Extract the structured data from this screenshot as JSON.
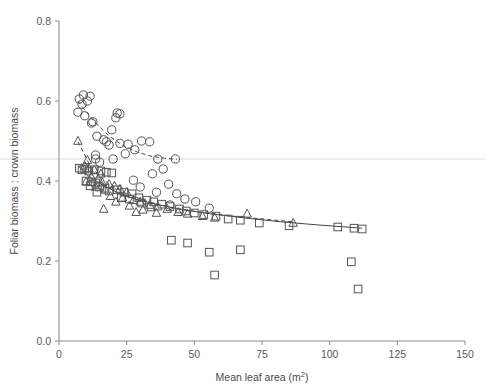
{
  "chart_data": {
    "type": "scatter",
    "title": "",
    "xlabel": "Mean leaf area (m²)",
    "ylabel": "Foliar biomass : crown biomass",
    "xlim": [
      0,
      150
    ],
    "ylim": [
      0.0,
      0.8
    ],
    "xticks": [
      0,
      25,
      50,
      75,
      100,
      125,
      150
    ],
    "xtick_labels": [
      "0",
      "25",
      "50",
      "75",
      "100",
      "125",
      "150"
    ],
    "yticks": [
      0.0,
      0.2,
      0.4,
      0.6,
      0.8
    ],
    "ytick_labels": [
      "0.0",
      "0.2",
      "0.4",
      "0.6",
      "0.8"
    ],
    "grid": false,
    "legend": "none",
    "marker_color": "#555555",
    "line_color": "#444444",
    "artifact_line_color": "#ededed",
    "artifact_line_y": 0.455,
    "series": [
      {
        "name": "circles",
        "marker": "circle",
        "points": [
          [
            7.5,
            0.605
          ],
          [
            8.5,
            0.592
          ],
          [
            9.0,
            0.615
          ],
          [
            10.5,
            0.6
          ],
          [
            11.5,
            0.612
          ],
          [
            7.0,
            0.572
          ],
          [
            9.5,
            0.563
          ],
          [
            12.0,
            0.545
          ],
          [
            12.5,
            0.548
          ],
          [
            21.5,
            0.57
          ],
          [
            22.5,
            0.568
          ],
          [
            21.0,
            0.558
          ],
          [
            19.5,
            0.528
          ],
          [
            14.0,
            0.512
          ],
          [
            16.5,
            0.503
          ],
          [
            17.5,
            0.498
          ],
          [
            18.5,
            0.49
          ],
          [
            22.5,
            0.494
          ],
          [
            25.5,
            0.492
          ],
          [
            30.5,
            0.5
          ],
          [
            33.5,
            0.498
          ],
          [
            28.0,
            0.478
          ],
          [
            24.5,
            0.468
          ],
          [
            13.5,
            0.465
          ],
          [
            13.5,
            0.455
          ],
          [
            15.0,
            0.447
          ],
          [
            20.0,
            0.455
          ],
          [
            36.5,
            0.455
          ],
          [
            43.0,
            0.455
          ],
          [
            38.5,
            0.43
          ],
          [
            34.5,
            0.418
          ],
          [
            27.5,
            0.402
          ],
          [
            40.5,
            0.392
          ],
          [
            30.0,
            0.385
          ],
          [
            36.0,
            0.372
          ],
          [
            43.5,
            0.368
          ],
          [
            46.5,
            0.355
          ],
          [
            50.5,
            0.348
          ],
          [
            41.0,
            0.34
          ],
          [
            55.5,
            0.332
          ]
        ]
      },
      {
        "name": "triangles",
        "marker": "triangle",
        "points": [
          [
            7.0,
            0.5
          ],
          [
            10.5,
            0.452
          ],
          [
            9.5,
            0.438
          ],
          [
            11.0,
            0.432
          ],
          [
            13.0,
            0.428
          ],
          [
            15.5,
            0.418
          ],
          [
            12.0,
            0.41
          ],
          [
            14.5,
            0.405
          ],
          [
            10.0,
            0.398
          ],
          [
            16.0,
            0.396
          ],
          [
            13.5,
            0.385
          ],
          [
            18.5,
            0.392
          ],
          [
            20.5,
            0.388
          ],
          [
            17.0,
            0.378
          ],
          [
            22.5,
            0.38
          ],
          [
            25.0,
            0.372
          ],
          [
            19.0,
            0.362
          ],
          [
            23.5,
            0.358
          ],
          [
            21.0,
            0.348
          ],
          [
            27.5,
            0.352
          ],
          [
            30.0,
            0.348
          ],
          [
            26.0,
            0.338
          ],
          [
            16.5,
            0.33
          ],
          [
            33.5,
            0.34
          ],
          [
            36.5,
            0.336
          ],
          [
            31.0,
            0.328
          ],
          [
            40.0,
            0.33
          ],
          [
            44.0,
            0.322
          ],
          [
            47.5,
            0.318
          ],
          [
            53.0,
            0.312
          ],
          [
            57.5,
            0.308
          ],
          [
            69.5,
            0.318
          ],
          [
            86.5,
            0.295
          ],
          [
            36.0,
            0.32
          ],
          [
            28.5,
            0.322
          ]
        ]
      },
      {
        "name": "squares",
        "marker": "square",
        "points": [
          [
            7.5,
            0.432
          ],
          [
            8.5,
            0.428
          ],
          [
            9.5,
            0.43
          ],
          [
            11.0,
            0.425
          ],
          [
            13.0,
            0.428
          ],
          [
            15.5,
            0.425
          ],
          [
            17.5,
            0.422
          ],
          [
            19.5,
            0.42
          ],
          [
            10.0,
            0.4
          ],
          [
            12.0,
            0.398
          ],
          [
            13.5,
            0.395
          ],
          [
            11.5,
            0.388
          ],
          [
            15.0,
            0.385
          ],
          [
            17.0,
            0.382
          ],
          [
            14.0,
            0.372
          ],
          [
            18.5,
            0.375
          ],
          [
            21.5,
            0.378
          ],
          [
            24.0,
            0.372
          ],
          [
            27.0,
            0.368
          ],
          [
            23.0,
            0.358
          ],
          [
            26.0,
            0.355
          ],
          [
            29.5,
            0.358
          ],
          [
            32.5,
            0.352
          ],
          [
            30.5,
            0.345
          ],
          [
            35.0,
            0.348
          ],
          [
            38.0,
            0.342
          ],
          [
            34.0,
            0.335
          ],
          [
            41.0,
            0.336
          ],
          [
            44.5,
            0.33
          ],
          [
            47.0,
            0.325
          ],
          [
            50.0,
            0.32
          ],
          [
            53.5,
            0.316
          ],
          [
            58.0,
            0.312
          ],
          [
            62.5,
            0.305
          ],
          [
            67.0,
            0.302
          ],
          [
            74.0,
            0.295
          ],
          [
            85.0,
            0.288
          ],
          [
            103.0,
            0.285
          ],
          [
            109.0,
            0.282
          ],
          [
            112.0,
            0.28
          ],
          [
            55.5,
            0.222
          ],
          [
            57.5,
            0.165
          ],
          [
            67.0,
            0.228
          ],
          [
            108.0,
            0.198
          ],
          [
            110.5,
            0.13
          ],
          [
            47.5,
            0.245
          ],
          [
            41.5,
            0.252
          ]
        ]
      }
    ],
    "trend_lines": [
      {
        "name": "circle-trend",
        "style": "dashed",
        "points": [
          [
            7.0,
            0.6
          ],
          [
            11.0,
            0.565
          ],
          [
            15.0,
            0.535
          ],
          [
            19.0,
            0.51
          ],
          [
            24.0,
            0.487
          ],
          [
            29.0,
            0.472
          ],
          [
            34.0,
            0.462
          ],
          [
            39.0,
            0.457
          ],
          [
            43.5,
            0.454
          ]
        ]
      },
      {
        "name": "triangle-trend",
        "style": "dashed",
        "points": [
          [
            7.0,
            0.498
          ],
          [
            12.0,
            0.432
          ],
          [
            18.0,
            0.395
          ],
          [
            25.0,
            0.368
          ],
          [
            33.0,
            0.348
          ],
          [
            42.0,
            0.333
          ],
          [
            52.0,
            0.322
          ],
          [
            63.0,
            0.313
          ],
          [
            75.0,
            0.305
          ],
          [
            86.5,
            0.298
          ]
        ]
      },
      {
        "name": "square-trend",
        "style": "solid",
        "points": [
          [
            7.0,
            0.438
          ],
          [
            11.0,
            0.412
          ],
          [
            16.0,
            0.39
          ],
          [
            22.0,
            0.37
          ],
          [
            29.0,
            0.353
          ],
          [
            37.0,
            0.34
          ],
          [
            46.0,
            0.328
          ],
          [
            56.0,
            0.318
          ],
          [
            68.0,
            0.308
          ],
          [
            82.0,
            0.298
          ],
          [
            96.0,
            0.29
          ],
          [
            112.0,
            0.282
          ]
        ]
      }
    ]
  }
}
